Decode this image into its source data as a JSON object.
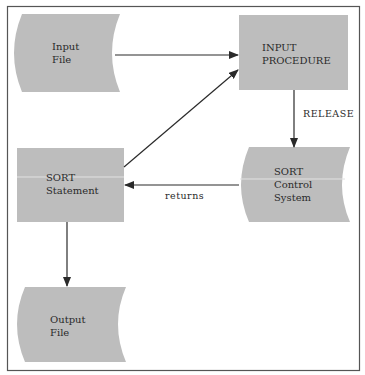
{
  "diagram": {
    "colors": {
      "frame": "#555555",
      "node_fill": "#bdbdbd",
      "edge": "#2a2a2a",
      "text": "#2a2a2a",
      "background": "#ffffff"
    },
    "nodes": {
      "input_file": {
        "shape": "file",
        "lines": [
          "Input",
          "File"
        ]
      },
      "input_procedure": {
        "shape": "process",
        "lines": [
          "INPUT",
          "PROCEDURE"
        ]
      },
      "sort_control_system": {
        "shape": "file",
        "lines": [
          "SORT",
          "Control",
          "System"
        ]
      },
      "sort_statement": {
        "shape": "process",
        "lines": [
          "SORT",
          "Statement"
        ]
      },
      "output_file": {
        "shape": "file",
        "lines": [
          "Output",
          "File"
        ]
      }
    },
    "edges": [
      {
        "from": "input_file",
        "to": "input_procedure",
        "label": ""
      },
      {
        "from": "sort_statement",
        "to": "input_procedure",
        "label": ""
      },
      {
        "from": "input_procedure",
        "to": "sort_control_system",
        "label": "RELEASE"
      },
      {
        "from": "sort_control_system",
        "to": "sort_statement",
        "label": "returns"
      },
      {
        "from": "sort_statement",
        "to": "output_file",
        "label": ""
      }
    ],
    "edge_labels": {
      "release": "RELEASE",
      "returns": "returns"
    }
  }
}
